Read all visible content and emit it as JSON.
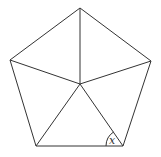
{
  "diagram": {
    "type": "geometry",
    "vertices": {
      "top": [
        80,
        8
      ],
      "upper_left": [
        10,
        60
      ],
      "upper_right": [
        151,
        61
      ],
      "bottom_left": [
        36,
        146
      ],
      "bottom_right": [
        123,
        146
      ],
      "center": [
        80,
        84
      ]
    },
    "angle_label": "x",
    "stroke_color": "#333333",
    "background": "#ffffff"
  }
}
